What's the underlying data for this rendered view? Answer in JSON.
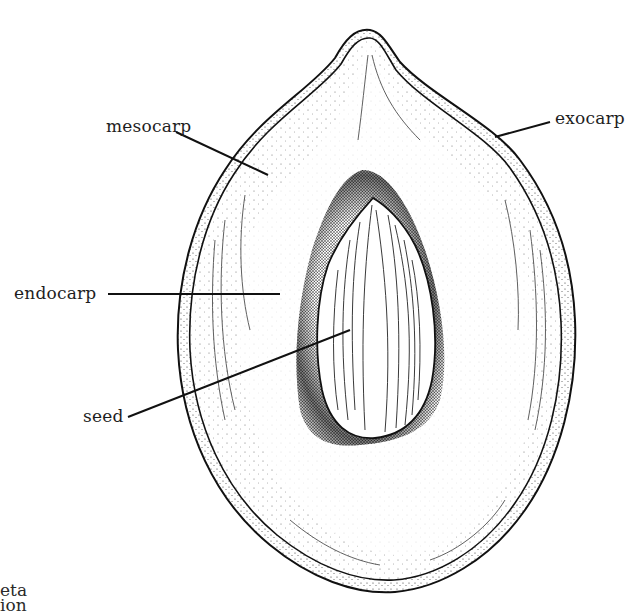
{
  "diagram": {
    "labels": [
      {
        "id": "mesocarp",
        "text": "mesocarp"
      },
      {
        "id": "exocarp",
        "text": "exocarp"
      },
      {
        "id": "endocarp",
        "text": "endocarp"
      },
      {
        "id": "seed",
        "text": "seed"
      }
    ],
    "cropped_caption": [
      "eta",
      "ion"
    ]
  },
  "colors": {
    "ink": "#1a1a1a",
    "background": "#ffffff"
  }
}
